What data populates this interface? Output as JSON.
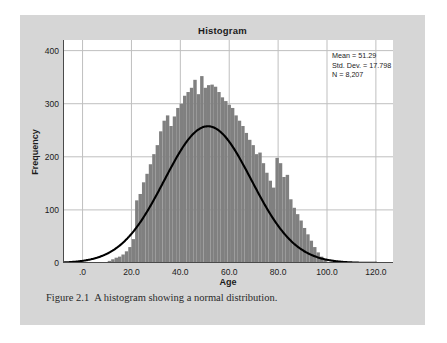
{
  "figure": {
    "caption_number": "Figure 2.1",
    "caption_text": "A histogram showing a normal distribution.",
    "panel_color": "#d6d6d6",
    "page_color": "#ffffff"
  },
  "stats": {
    "mean_line": "Mean = 51.29",
    "stddev_line": "Std. Dev. = 17.798",
    "n_line": "N = 8,207"
  },
  "chart_data": {
    "type": "bar",
    "title": "Histogram",
    "xlabel": "Age",
    "ylabel": "Frequency",
    "xlim": [
      -8,
      127
    ],
    "ylim": [
      0,
      420
    ],
    "xticks": [
      0,
      20,
      40,
      60,
      80,
      100,
      120
    ],
    "xticklabels": [
      ".0",
      "20.0",
      "40.0",
      "60.0",
      "80.0",
      "100.0",
      "120.0"
    ],
    "yticks": [
      0,
      100,
      200,
      300,
      400
    ],
    "yticklabels": [
      "0",
      "100",
      "200",
      "300",
      "400"
    ],
    "grid": true,
    "grid_color": "#bfbfbf",
    "bar_color": "#808080",
    "bar_width": 1.4,
    "legend": "none",
    "annotations": [
      "Mean = 51.29",
      "Std. Dev. = 17.798",
      "N = 8,207"
    ],
    "categories": [
      11,
      12.4,
      13.8,
      15.2,
      16.6,
      18,
      19.4,
      20.8,
      22.2,
      23.6,
      25,
      26.4,
      27.8,
      29.2,
      30.6,
      32,
      33.4,
      34.8,
      36.2,
      37.6,
      39,
      40.4,
      41.8,
      43.2,
      44.6,
      46,
      47.4,
      48.8,
      50.2,
      51.6,
      53,
      54.4,
      55.8,
      57.2,
      58.6,
      60,
      61.4,
      62.8,
      64.2,
      65.6,
      67,
      68.4,
      69.8,
      71.2,
      72.6,
      74,
      75.4,
      76.8,
      78.2,
      79.6,
      81,
      82.4,
      83.8,
      85.2,
      86.6,
      88,
      89.4,
      90.8,
      92.2,
      93.6,
      95,
      96.4,
      97.8,
      99.2
    ],
    "values": [
      4,
      7,
      10,
      12,
      16,
      22,
      30,
      45,
      118,
      130,
      152,
      168,
      186,
      205,
      222,
      248,
      268,
      278,
      258,
      276,
      292,
      300,
      315,
      322,
      330,
      345,
      318,
      352,
      330,
      335,
      336,
      332,
      322,
      312,
      305,
      298,
      292,
      278,
      268,
      258,
      245,
      232,
      222,
      205,
      208,
      188,
      170,
      155,
      142,
      198,
      188,
      162,
      166,
      120,
      104,
      92,
      80,
      66,
      54,
      42,
      30,
      20,
      12,
      6
    ],
    "curve": {
      "kind": "normal",
      "mean": 51.29,
      "stddev": 17.798,
      "n": 8207,
      "bin_width": 1.4,
      "color": "#000000",
      "peak_value": 368
    }
  }
}
